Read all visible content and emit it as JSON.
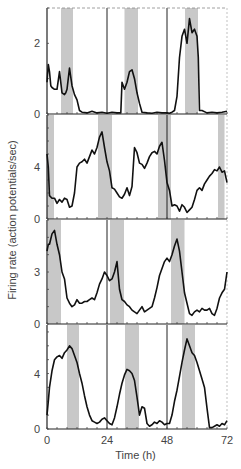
{
  "chart_data": {
    "type": "line",
    "title": "",
    "xlabel": "Time (h)",
    "ylabel": "Firing rate (action potentials/sec)",
    "xlim": [
      0,
      72
    ],
    "xticks": [
      0,
      24,
      48,
      72
    ],
    "grid": false,
    "legend": null,
    "shade_color": "#c8c8c8",
    "line_color": "#111111",
    "panels": [
      {
        "id": 1,
        "ylim": [
          0,
          3
        ],
        "yticks": [
          0,
          2
        ],
        "shaded_bands_h": [
          [
            5.6,
            10.4
          ],
          [
            31,
            36.4
          ],
          [
            55.2,
            60.4
          ]
        ],
        "vlines_h": [
          24,
          48
        ],
        "x": [
          0,
          0.5,
          1,
          1.5,
          2,
          3,
          4,
          5,
          6,
          7,
          7.5,
          8,
          9,
          10,
          11,
          12,
          13,
          14,
          16,
          18,
          20,
          22,
          24,
          26,
          28,
          29.5,
          30,
          31,
          32,
          33,
          34,
          35,
          36,
          37,
          38,
          40,
          42,
          44,
          46,
          48,
          49,
          50,
          51,
          52,
          53,
          54,
          55,
          56,
          57,
          58,
          59,
          60,
          60.5,
          61,
          62,
          64,
          66,
          68,
          70,
          72
        ],
        "y": [
          0.9,
          1.4,
          1.2,
          0.8,
          0.75,
          0.7,
          0.7,
          1.2,
          0.6,
          0.55,
          0.6,
          0.7,
          1.3,
          0.8,
          0.55,
          0.4,
          0.1,
          0.05,
          0.03,
          0.08,
          0.03,
          0.05,
          0.02,
          0.05,
          0.03,
          0.03,
          0.9,
          0.7,
          0.9,
          1.2,
          1.25,
          1.0,
          0.6,
          0.3,
          0.05,
          0.03,
          0.02,
          0.05,
          0.03,
          0.03,
          0.02,
          0.05,
          0.1,
          0.5,
          1.6,
          2.2,
          2.4,
          2.0,
          2.7,
          2.3,
          2.4,
          2.2,
          1.6,
          0.1,
          0.1,
          0.03,
          0.05,
          0.03,
          0.05,
          0.08
        ]
      },
      {
        "id": 2,
        "ylim": [
          0,
          8
        ],
        "yticks": [
          0,
          4
        ],
        "shaded_bands_h": [
          [
            0,
            2.8
          ],
          [
            20.4,
            26
          ],
          [
            44.4,
            49.6
          ],
          [
            68.4,
            71
          ]
        ],
        "vlines_h": [
          48
        ],
        "x": [
          0,
          0.5,
          1,
          2,
          3,
          4,
          5,
          6,
          7,
          8,
          9,
          10,
          11,
          12,
          13,
          14,
          15,
          16,
          17,
          18,
          19,
          20,
          21,
          22,
          23,
          24,
          25,
          26,
          27,
          28,
          29,
          30,
          31,
          32,
          33,
          34,
          35,
          36,
          37,
          38,
          39,
          40,
          41,
          42,
          43,
          44,
          45,
          46,
          47,
          48,
          49,
          50,
          51,
          52,
          53,
          54,
          55,
          56,
          57,
          58,
          59,
          60,
          61,
          62,
          63,
          64,
          65,
          66,
          67,
          68,
          69,
          70,
          71,
          72
        ],
        "y": [
          5.0,
          4.0,
          1.8,
          1.6,
          1.6,
          1.2,
          1.5,
          1.3,
          1.6,
          1.5,
          0.9,
          1.0,
          2.0,
          4.0,
          4.3,
          4.4,
          4.6,
          4.3,
          4.8,
          5.3,
          5.0,
          5.5,
          6.3,
          6.7,
          5.5,
          4.4,
          3.7,
          2.4,
          2.3,
          2.0,
          1.7,
          1.6,
          1.9,
          2.4,
          1.8,
          2.5,
          5.5,
          5.1,
          4.3,
          4.2,
          3.9,
          4.3,
          4.8,
          5.1,
          5.2,
          5.0,
          5.6,
          5.9,
          4.5,
          2.8,
          2.2,
          1.0,
          1.1,
          1.0,
          0.6,
          1.1,
          0.9,
          0.5,
          0.7,
          0.9,
          1.5,
          2.2,
          2.4,
          2.2,
          2.7,
          3.0,
          3.3,
          3.5,
          3.8,
          3.7,
          4.0,
          3.6,
          3.7,
          2.8
        ]
      },
      {
        "id": 3,
        "ylim": [
          0,
          6
        ],
        "yticks": [
          0,
          3
        ],
        "shaded_bands_h": [
          [
            0.4,
            5.6
          ],
          [
            25.2,
            30.8
          ],
          [
            49.6,
            55
          ]
        ],
        "vlines_h": [
          24
        ],
        "x": [
          0,
          0.5,
          1,
          2,
          3,
          4,
          5,
          6,
          7,
          8,
          9,
          10,
          11,
          12,
          13,
          14,
          15,
          16,
          17,
          18,
          19,
          20,
          21,
          22,
          23,
          24,
          25,
          26,
          27,
          28,
          29,
          30,
          31,
          32,
          33,
          34,
          35,
          36,
          37,
          38,
          39,
          40,
          41,
          42,
          43,
          44,
          45,
          46,
          47,
          48,
          49,
          50,
          51,
          52,
          53,
          54,
          55,
          56,
          57,
          58,
          59,
          60,
          61,
          62,
          63,
          64,
          65,
          66,
          67,
          68,
          69,
          70,
          71,
          72
        ],
        "y": [
          4.2,
          4.6,
          4.6,
          5.2,
          5.4,
          4.6,
          4.0,
          3.0,
          2.6,
          1.5,
          1.2,
          1.0,
          1.1,
          1.4,
          1.2,
          1.2,
          1.3,
          1.3,
          1.4,
          1.5,
          1.4,
          1.8,
          2.3,
          2.6,
          3.0,
          2.8,
          2.5,
          2.6,
          3.0,
          3.6,
          2.0,
          1.4,
          1.3,
          1.1,
          1.0,
          0.8,
          0.7,
          0.6,
          0.8,
          1.0,
          0.7,
          0.8,
          0.9,
          1.0,
          1.5,
          2.1,
          2.8,
          3.2,
          3.6,
          3.8,
          3.6,
          4.0,
          4.5,
          4.9,
          4.2,
          3.0,
          1.8,
          1.2,
          0.6,
          0.5,
          0.7,
          0.8,
          0.7,
          0.9,
          0.8,
          0.8,
          0.9,
          0.6,
          0.5,
          0.9,
          1.5,
          1.8,
          2.0,
          3.0
        ]
      },
      {
        "id": 4,
        "ylim": [
          0,
          7.5
        ],
        "yticks": [
          0,
          4
        ],
        "shaded_bands_h": [
          [
            8,
            12.8
          ],
          [
            31.2,
            36.8
          ],
          [
            54,
            59.2
          ]
        ],
        "vlines_h": [
          24,
          48
        ],
        "x": [
          0,
          0.5,
          1,
          2,
          3,
          4,
          5,
          6,
          7,
          8,
          9,
          10,
          11,
          12,
          13,
          14,
          15,
          16,
          17,
          18,
          19,
          20,
          21,
          22,
          23,
          24,
          25,
          26,
          27,
          28,
          29,
          30,
          31,
          32,
          33,
          34,
          35,
          36,
          37,
          38,
          39,
          40,
          41,
          42,
          43,
          44,
          45,
          46,
          47,
          48,
          49,
          50,
          51,
          52,
          53,
          54,
          55,
          56,
          57,
          58,
          59,
          60,
          61,
          62,
          63,
          64,
          65,
          66,
          67,
          68,
          69,
          70,
          71,
          72
        ],
        "y": [
          1.0,
          2.0,
          3.0,
          4.2,
          5.0,
          5.2,
          5.3,
          5.1,
          5.5,
          5.7,
          6.0,
          5.8,
          5.3,
          4.8,
          4.0,
          3.3,
          2.4,
          1.6,
          1.0,
          0.6,
          0.5,
          0.4,
          0.5,
          0.7,
          0.8,
          0.6,
          0.4,
          0.3,
          0.8,
          1.6,
          2.5,
          3.3,
          3.9,
          4.3,
          4.2,
          4.0,
          3.5,
          2.3,
          1.0,
          1.6,
          1.5,
          0.4,
          0.2,
          0.3,
          0.5,
          0.4,
          0.6,
          0.5,
          0.3,
          0.4,
          0.4,
          1.0,
          2.0,
          2.8,
          3.8,
          4.8,
          5.7,
          6.5,
          6.0,
          5.5,
          5.3,
          4.8,
          4.2,
          3.6,
          3.0,
          1.5,
          0.1,
          0.1,
          0.2,
          0.3,
          0.2,
          0.4,
          0.3,
          0.6
        ]
      }
    ]
  },
  "axis": {
    "xlabel": "Time (h)",
    "ylabel": "Firing rate (action potentials/sec)",
    "xtick_labels": [
      "0",
      "24",
      "48",
      "72"
    ]
  }
}
